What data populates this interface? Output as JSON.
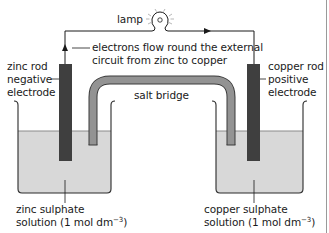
{
  "diagram": {
    "colors": {
      "electrode": "#3f3f3f",
      "salt_bridge": "#8f8f8f",
      "solution": "#d8d8d8",
      "wire": "#1a1a1a",
      "beaker_outline": "#2a2a2a"
    },
    "labels": {
      "lamp": "lamp",
      "electron_flow_line1": "electrons flow round the external",
      "electron_flow_line2": "circuit from zinc to copper",
      "zinc_rod_line1": "zinc rod",
      "zinc_rod_line2": "negative",
      "zinc_rod_line3": "electrode",
      "copper_rod_line1": "copper rod",
      "copper_rod_line2": "positive",
      "copper_rod_line3": "electrode",
      "salt_bridge": "salt bridge",
      "zinc_solution_line1": "zinc sulphate",
      "zinc_solution_line2_prefix": "solution (1 mol dm",
      "zinc_solution_exponent": "−3",
      "zinc_solution_line2_suffix": ")",
      "copper_solution_line1": "copper sulphate",
      "copper_solution_line2_prefix": "solution (1 mol dm",
      "copper_solution_exponent": "−3",
      "copper_solution_line2_suffix": ")"
    },
    "components": {
      "left_beaker": "zinc sulphate beaker",
      "right_beaker": "copper sulphate beaker",
      "left_electrode": "zinc rod",
      "right_electrode": "copper rod",
      "bridge": "salt bridge",
      "bulb": "lamp"
    }
  }
}
